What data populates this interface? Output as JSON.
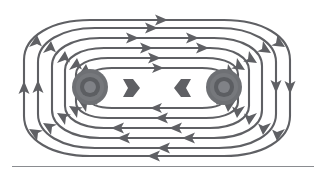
{
  "figure": {
    "caption": "",
    "background_color": "#ffffff",
    "line_color": "#5f6064",
    "pole_color": "#6e7074",
    "rule_color": "#8a8c90"
  },
  "chart_data": {
    "type": "diagram",
    "xlabel": "",
    "ylabel": "",
    "grid": false,
    "legend": "none",
    "canvas": {
      "width": 314,
      "height": 173
    },
    "flow_direction": "clockwise",
    "poles": [
      {
        "name": "left-pole",
        "cx": 90,
        "cy": 87,
        "radius": 18,
        "fill": "#6e7074",
        "rings": 4
      },
      {
        "name": "right-pole",
        "cx": 224,
        "cy": 87,
        "radius": 18,
        "fill": "#6e7074",
        "rings": 4
      }
    ],
    "dipole_markers": [
      {
        "name": "left-dipole-arrow",
        "cx": 130,
        "cy": 88,
        "direction": "right"
      },
      {
        "name": "right-dipole-arrow",
        "cx": 184,
        "cy": 88,
        "direction": "left"
      }
    ],
    "loops": [
      {
        "index": 0,
        "label": "innermost-loop",
        "rx": 46,
        "ry": 26,
        "cx": 157,
        "cy": 88,
        "arrow_count": 8
      },
      {
        "index": 1,
        "label": "loop-2",
        "rx": 62,
        "ry": 36,
        "cx": 157,
        "cy": 88,
        "arrow_count": 8
      },
      {
        "index": 2,
        "label": "loop-3",
        "rx": 78,
        "ry": 46,
        "cx": 157,
        "cy": 88,
        "arrow_count": 8
      },
      {
        "index": 3,
        "label": "loop-4",
        "rx": 95,
        "ry": 55,
        "cx": 157,
        "cy": 88,
        "arrow_count": 8
      },
      {
        "index": 4,
        "label": "loop-5",
        "rx": 112,
        "ry": 62,
        "cx": 157,
        "cy": 88,
        "arrow_count": 6
      },
      {
        "index": 5,
        "label": "outermost-loop",
        "rx": 128,
        "ry": 68,
        "cx": 157,
        "cy": 88,
        "arrow_count": 6
      }
    ],
    "arrow_directions": {
      "top": "right",
      "right": "down",
      "bottom": "left",
      "left": "up"
    },
    "baseline_rule": {
      "x": 12,
      "y": 166,
      "width": 302,
      "color": "#8a8c90"
    }
  }
}
